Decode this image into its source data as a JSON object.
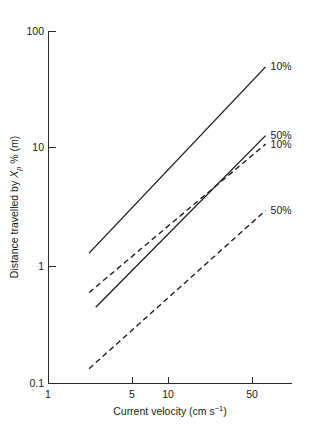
{
  "chart_data": {
    "type": "line",
    "title": "",
    "xlabel": "Current velocity (cm s⁻¹)",
    "ylabel": "Distance travelled by Xp % (m)",
    "ylabel_parts": {
      "prefix": "Distance travelled by ",
      "var": "X",
      "sub": "p",
      "suffix": " % (m)"
    },
    "xlabel_parts": {
      "prefix": "Current velocity (cm s",
      "sup": "−1",
      "suffix": ")"
    },
    "xscale": "log",
    "yscale": "log",
    "xlim": [
      1,
      70
    ],
    "ylim": [
      0.1,
      100
    ],
    "grid": false,
    "legend_position": "right-of-line-ends",
    "xticks": [
      1,
      5,
      10,
      50
    ],
    "xtick_labels": [
      "1",
      "5",
      "10",
      "50"
    ],
    "yticks": [
      0.1,
      1,
      10,
      100
    ],
    "ytick_labels": [
      "0.1",
      "1",
      "10",
      "100"
    ],
    "series": [
      {
        "name": "10% solid",
        "label": "10%",
        "style": "solid",
        "x": [
          2.2,
          65
        ],
        "y": [
          1.3,
          50
        ]
      },
      {
        "name": "50% solid",
        "label": "50%",
        "style": "solid",
        "x": [
          2.5,
          65
        ],
        "y": [
          0.45,
          13
        ]
      },
      {
        "name": "10% dashed",
        "label": "10%",
        "style": "dashed",
        "x": [
          2.2,
          65
        ],
        "y": [
          0.6,
          11
        ]
      },
      {
        "name": "50% dashed",
        "label": "50%",
        "style": "dashed",
        "x": [
          2.2,
          65
        ],
        "y": [
          0.135,
          3.0
        ]
      }
    ],
    "annotations": [
      {
        "text": "10%",
        "anchor_series": "10% solid"
      },
      {
        "text": "50%",
        "anchor_series": "50% solid"
      },
      {
        "text": "10%",
        "anchor_series": "10% dashed"
      },
      {
        "text": "50%",
        "anchor_series": "50% dashed"
      }
    ],
    "colors": {
      "axis": "#2b2b2b",
      "line": "#1a1a1a",
      "background": "#ffffff"
    }
  }
}
